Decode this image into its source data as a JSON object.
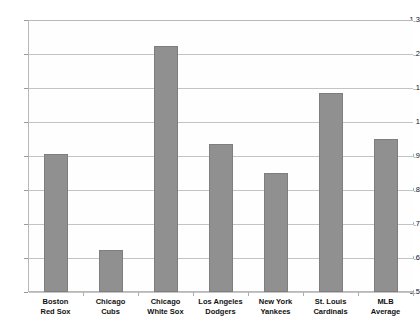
{
  "chart_data": {
    "type": "bar",
    "title": "",
    "subtitle": "",
    "xlabel": "",
    "ylabel": "",
    "categories": [
      "Boston\nRed Sox",
      "Chicago\nCubs",
      "Chicago\nWhite Sox",
      "Los Angeles\nDodgers",
      "New York\nYankees",
      "St. Louis\nCardinals",
      "MLB\nAverage"
    ],
    "values": [
      0.905,
      0.625,
      1.225,
      0.935,
      0.85,
      1.085,
      0.95
    ],
    "ylim": [
      0.5,
      1.3
    ],
    "ytick_labels": [
      "1.3",
      "1.2",
      "1.1",
      "1",
      "0.9",
      "0.8",
      "0.7",
      "0.6",
      "0.5"
    ],
    "ytick_values": [
      1.3,
      1.2,
      1.1,
      1.0,
      0.9,
      0.8,
      0.7,
      0.6,
      0.5
    ],
    "grid": true,
    "legend": false,
    "legend_position": "none",
    "bar_color": "#909090",
    "bar_border_color": "#7e7e7e",
    "gridline_color": "#c4c4c4",
    "axis_color": "#b9b9b9",
    "background_color": "#ffffff",
    "plot_background_color": "#fefefe"
  }
}
